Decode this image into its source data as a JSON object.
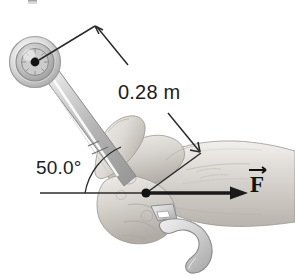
{
  "figure": {
    "background_color": "#ffffff",
    "labels": {
      "distance": "0.28 m",
      "angle": "50.0°",
      "force": "F"
    },
    "icons": {
      "socket_head": "socket-wrench-head-icon",
      "open_end_jaw": "open-end-wrench-jaw-icon",
      "hand": "hand-gripping-icon",
      "force_arrow": "force-arrow-icon",
      "dimension_arrow": "dimension-arrow-icon",
      "angle_arc": "angle-arc-icon",
      "pivot_dot": "pivot-point-dot-icon",
      "application_dot": "force-application-dot-icon"
    },
    "colors": {
      "line": "#2b2b2b",
      "text": "#1c1c1c",
      "metal_light": "#e3e3e3",
      "metal_mid": "#bdbdbd",
      "metal_dark": "#8f8f8f",
      "skin_light": "#e8e6e3",
      "skin_mid": "#cfcbc6",
      "skin_dark": "#a8a39d",
      "force_arrow": "#1a1a1a"
    },
    "geometry": {
      "pivot_point": [
        35,
        62
      ],
      "force_point": [
        146,
        193
      ],
      "lever_arm_length_label": "0.28 m",
      "handle_angle_degrees": 50.0,
      "force_direction": "horizontal-right"
    }
  }
}
